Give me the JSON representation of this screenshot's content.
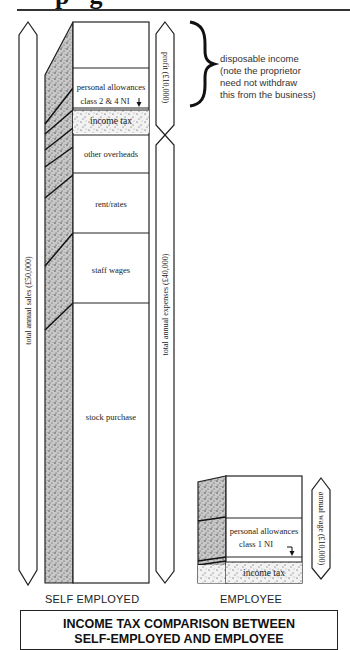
{
  "header": {
    "partial_glyphs": "pg"
  },
  "note": {
    "lines": [
      "disposable income",
      "(note the proprietor",
      "need not withdraw",
      "this from the business)"
    ]
  },
  "self_employed": {
    "caption": "SELF EMPLOYED",
    "arrows": {
      "total_sales": "total annual sales (£50,000)",
      "profit": "profit (£10,000)",
      "expenses": "total annual expenses (£40,000)"
    },
    "segments": {
      "personal_allowances": "personal allowances",
      "class_ni": "class 2 & 4 NI",
      "income_tax": "income tax",
      "other_overheads": "other overheads",
      "rent_rates": "rent/rates",
      "staff_wages": "staff wages",
      "stock_purchase": "stock purchase"
    }
  },
  "employee": {
    "caption": "EMPLOYEE",
    "arrows": {
      "annual_wage": "annual wage (£10,000)"
    },
    "segments": {
      "personal_allowances": "personal allowances",
      "class_ni": "class 1 NI",
      "income_tax": "income tax"
    }
  },
  "title": {
    "line1": "INCOME TAX COMPARISON BETWEEN",
    "line2": "SELF-EMPLOYED AND EMPLOYEE"
  },
  "colors": {
    "ink": "#1a1a1a",
    "stipple": "#9a9a9a",
    "background": "#ffffff"
  }
}
